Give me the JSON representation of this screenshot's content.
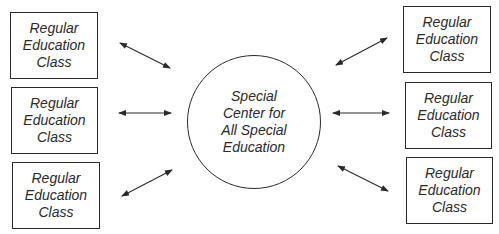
{
  "diagram": {
    "center": {
      "lines": [
        "Special",
        "Center for",
        "All Special",
        "Education"
      ]
    },
    "left_classes": [
      {
        "lines": [
          "Regular",
          "Education",
          "Class"
        ]
      },
      {
        "lines": [
          "Regular",
          "Education",
          "Class"
        ]
      },
      {
        "lines": [
          "Regular",
          "Education",
          "Class"
        ]
      }
    ],
    "right_classes": [
      {
        "lines": [
          "Regular",
          "Education",
          "Class"
        ]
      },
      {
        "lines": [
          "Regular",
          "Education",
          "Class"
        ]
      },
      {
        "lines": [
          "Regular",
          "Education",
          "Class"
        ]
      }
    ],
    "connections": [
      {
        "from": "left_classes.0",
        "to": "center",
        "type": "bidirectional"
      },
      {
        "from": "left_classes.1",
        "to": "center",
        "type": "bidirectional"
      },
      {
        "from": "left_classes.2",
        "to": "center",
        "type": "bidirectional"
      },
      {
        "from": "right_classes.0",
        "to": "center",
        "type": "bidirectional"
      },
      {
        "from": "right_classes.1",
        "to": "center",
        "type": "bidirectional"
      },
      {
        "from": "right_classes.2",
        "to": "center",
        "type": "bidirectional"
      }
    ],
    "colors": {
      "stroke": "#2a2a2a",
      "background": "#ffffff"
    }
  }
}
